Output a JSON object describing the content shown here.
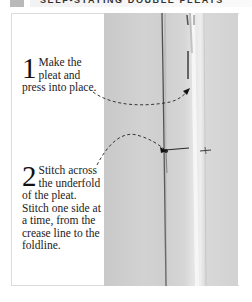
{
  "header": {
    "title": "SELF-STAYING DOUBLE PLEATS",
    "accent_color": "#b9b9b9"
  },
  "steps": [
    {
      "number": "1",
      "text": "Make the pleat and press into place."
    },
    {
      "number": "2",
      "text": "Stitch across the underfold of the pleat. Stitch one side at a time, from the crease line to the foldline."
    }
  ],
  "photo": {
    "subject": "fabric-pleat-photo",
    "annotations": [
      "dashed-arrow-step-1",
      "dashed-arrow-step-2"
    ]
  }
}
